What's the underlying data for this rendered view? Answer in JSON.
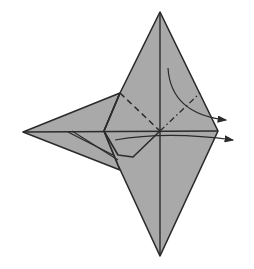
{
  "diagram": {
    "type": "origami-step",
    "paper_color": "#a9a9a9",
    "line_color": "#2b2b2b",
    "background": "#ffffff",
    "elements": {
      "main_diamond": {
        "top": [
          160,
          12
        ],
        "right": [
          218,
          131
        ],
        "bottom": [
          160,
          256
        ],
        "left_notch": [
          104,
          131
        ]
      },
      "left_flap": {
        "tip": [
          23,
          132
        ],
        "upper": [
          120,
          93
        ],
        "lower": [
          120,
          170
        ]
      },
      "square_flap": {
        "top": [
          120,
          93
        ],
        "left": [
          104,
          131
        ],
        "bottom": [
          133,
          157
        ],
        "center": [
          160,
          131
        ]
      },
      "valley_fold_line": "dashed from upper-left square corner to center",
      "mountain_fold_line": "dash-dot from center to upper-right edge",
      "arrows": [
        "curved arrow from upper area pointing right",
        "arrow along horizontal center pointing right"
      ]
    }
  }
}
